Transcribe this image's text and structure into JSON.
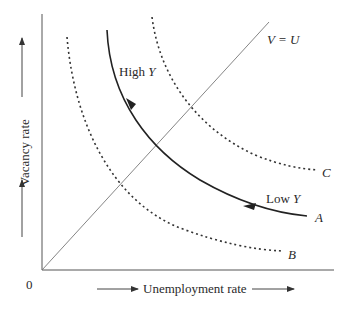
{
  "diagram": {
    "type": "beveridge-curve",
    "axes": {
      "x_label": "Unemployment rate",
      "y_label": "Vacancy rate",
      "origin_label": "0"
    },
    "reference_line": {
      "label": "V = U"
    },
    "curves": [
      {
        "id": "A",
        "label": "A",
        "style": "solid",
        "direction_arrow": true
      },
      {
        "id": "B",
        "label": "B",
        "style": "dotted"
      },
      {
        "id": "C",
        "label": "C",
        "style": "dotted"
      }
    ],
    "annotations": {
      "high_y": "High",
      "low_y": "Low",
      "y_symbol": "Y"
    }
  }
}
